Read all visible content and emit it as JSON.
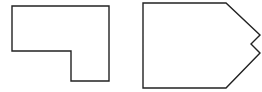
{
  "diagram": {
    "stroke_color": "#222222",
    "fill_color": "#ffffff",
    "shapes": [
      {
        "name": "l-shaped-polygon",
        "points": "12,6 109,6 109,81 71,81 71,51 12,51"
      },
      {
        "name": "notched-pentagon",
        "points": "143,3 226,3 260,35 251,44 260,53 226,88 143,88"
      }
    ]
  }
}
